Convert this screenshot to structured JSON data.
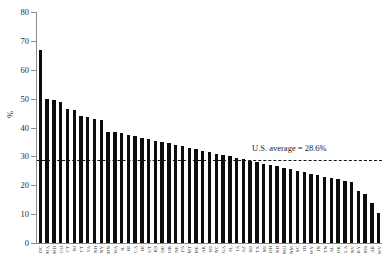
{
  "chart_data": {
    "type": "bar",
    "title": "",
    "xlabel": "",
    "ylabel": "%",
    "ylim": [
      0,
      80
    ],
    "ytick_step": 10,
    "yticks": [
      80,
      70,
      60,
      50,
      40,
      30,
      20,
      10,
      0
    ],
    "grid": false,
    "legend": null,
    "orientation": "vertical",
    "bar_color": "#0d0d0d",
    "annotations": [
      {
        "name": "us-average-reference-line",
        "label": "U.S. average = 28.6%",
        "value": 28.6,
        "style": "dashed",
        "color": "#141414"
      }
    ],
    "categories": [
      "DC",
      "MA",
      "MD",
      "CO",
      "CT",
      "NJ",
      "VT",
      "VA",
      "NH",
      "NY",
      "MN",
      "WA",
      "IL",
      "RI",
      "CA",
      "HI",
      "UT",
      "KS",
      "DE",
      "OR",
      "NE",
      "PA",
      "MT",
      "ME",
      "AK",
      "WI",
      "NC",
      "GA",
      "FL",
      "IA",
      "AZ",
      "SD",
      "TX",
      "MI",
      "OH",
      "ND",
      "MO",
      "NM",
      "SC",
      "ID",
      "WY",
      "IN",
      "TN",
      "AL",
      "OK",
      "LA",
      "NV",
      "KY",
      "MS",
      "AR",
      "WV"
    ],
    "values": [
      67,
      50,
      49.5,
      49,
      46.5,
      46,
      44,
      43.5,
      43,
      42.5,
      38.5,
      38.5,
      38,
      37.5,
      37,
      36.5,
      36,
      35.5,
      35,
      34.5,
      34,
      33.5,
      33,
      32.5,
      32,
      31.5,
      31,
      30.5,
      30,
      29.5,
      29,
      28.5,
      28,
      27.5,
      27,
      26.5,
      26,
      25.5,
      25,
      24.5,
      24,
      23.5,
      23,
      22.5,
      22,
      21.5,
      21,
      18,
      17,
      14,
      10.5
    ]
  },
  "accessibility": {
    "chart_description": "Bar chart of percent by state in descending order with a dashed U.S. average reference line."
  }
}
